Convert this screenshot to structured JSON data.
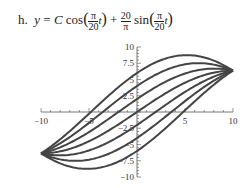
{
  "title": {
    "label": "h.",
    "equation": "y = C cos(π/20 t) + 20/π sin(π/20 t)"
  },
  "chart_data": {
    "type": "line",
    "xlabel": "",
    "ylabel": "",
    "xlim": [
      -10,
      10
    ],
    "ylim": [
      -10,
      10
    ],
    "xticks": [
      -10,
      -5,
      5,
      10
    ],
    "yticks": [
      10,
      7.5,
      5,
      2.5,
      -2.5,
      -5,
      -7.5,
      -10
    ],
    "grid": false,
    "series": [
      {
        "name": "C=-6",
        "C": -6
      },
      {
        "name": "C=-4",
        "C": -4
      },
      {
        "name": "C=-2",
        "C": -2
      },
      {
        "name": "C=0",
        "C": 0
      },
      {
        "name": "C=2",
        "C": 2
      },
      {
        "name": "C=4",
        "C": 4
      },
      {
        "name": "C=6",
        "C": 6
      }
    ],
    "line_color": "#444444"
  }
}
